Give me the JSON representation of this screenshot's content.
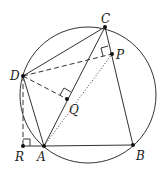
{
  "diagram": {
    "circle": {
      "cx": 88,
      "cy": 95,
      "r": 68
    },
    "points": {
      "A": {
        "x": 44,
        "y": 146,
        "label": "A"
      },
      "B": {
        "x": 133,
        "y": 145,
        "label": "B"
      },
      "C": {
        "x": 105,
        "y": 27,
        "label": "C"
      },
      "D": {
        "x": 23,
        "y": 76,
        "label": "D"
      },
      "P": {
        "x": 112,
        "y": 54,
        "label": "P"
      },
      "Q": {
        "x": 67,
        "y": 99,
        "label": "Q"
      },
      "R": {
        "x": 23,
        "y": 146,
        "label": "R"
      }
    },
    "solid_segments": [
      "AB",
      "BC",
      "CD",
      "DA",
      "AC",
      "RA"
    ],
    "dashed_segments": [
      "DP",
      "DQ",
      "DR"
    ],
    "dotted_segments": [
      "AP"
    ],
    "right_angles": [
      "P (DP ⟂ BC)",
      "Q (DQ ⟂ AC)",
      "R (DR ⟂ AB)"
    ]
  }
}
